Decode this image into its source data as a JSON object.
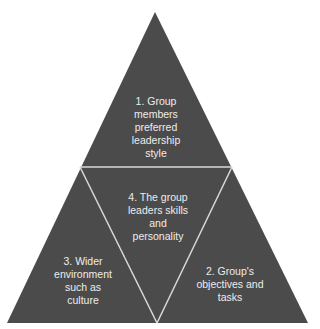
{
  "diagram": {
    "type": "triangle-segmented",
    "colors": {
      "fill": "#4b4b4b",
      "divider": "#d9d9d9",
      "text": "#ededed",
      "background": "#ffffff"
    },
    "segments": [
      {
        "id": 1,
        "position": "top",
        "label": "1. Group\nmembers\npreferred\nleadership\nstyle"
      },
      {
        "id": 2,
        "position": "bottom-right",
        "label": "2. Group's\nobjectives and\ntasks"
      },
      {
        "id": 3,
        "position": "bottom-left",
        "label": "3. Wider\nenvironment\nsuch as\nculture"
      },
      {
        "id": 4,
        "position": "center",
        "label": "4. The group\nleaders skills\nand\npersonality"
      }
    ]
  }
}
